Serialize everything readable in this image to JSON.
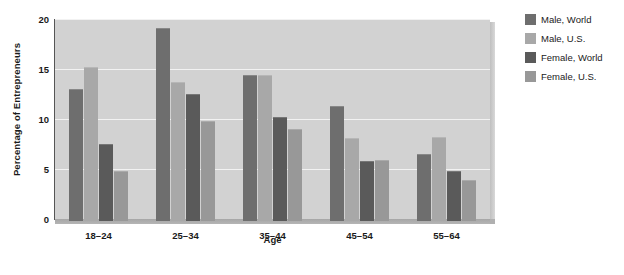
{
  "chart_data": {
    "type": "bar",
    "title": "",
    "xlabel": "Age",
    "ylabel": "Percentage of Entrepreneurs",
    "categories": [
      "18–24",
      "25–34",
      "35–44",
      "45–54",
      "55–64"
    ],
    "ylim": [
      0,
      20
    ],
    "yticks": [
      0,
      5,
      10,
      15,
      20
    ],
    "ytick_labels": [
      "0",
      "5",
      "10",
      "15",
      "20"
    ],
    "grid": true,
    "legend_position": "right",
    "series": [
      {
        "name": "Male, World",
        "color": "#6e6e6e",
        "values": [
          13.2,
          19.3,
          14.6,
          11.5,
          6.7
        ]
      },
      {
        "name": "Male, U.S.",
        "color": "#a8a8a8",
        "values": [
          15.4,
          13.9,
          14.6,
          8.3,
          8.4
        ]
      },
      {
        "name": "Female, World",
        "color": "#5a5a5a",
        "values": [
          7.7,
          12.7,
          10.4,
          6.0,
          5.0
        ]
      },
      {
        "name": "Female, U.S.",
        "color": "#989898",
        "values": [
          5.0,
          10.0,
          9.2,
          6.1,
          4.1
        ]
      }
    ]
  },
  "colors": {
    "plot_background": "#d2d2d2",
    "gridline": "#f2f2f2",
    "axis": "#555555",
    "text": "#1a1a1a",
    "page_background": "#ffffff"
  }
}
